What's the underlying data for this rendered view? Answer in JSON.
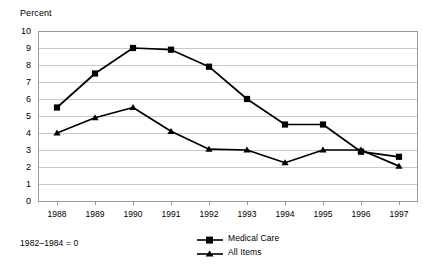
{
  "chart_data": {
    "type": "line",
    "title": "",
    "ylabel": "Percent",
    "xlabel": "",
    "note": "1982–1984 = 0",
    "categories": [
      "1988",
      "1989",
      "1990",
      "1991",
      "1992",
      "1993",
      "1994",
      "1995",
      "1996",
      "1997"
    ],
    "ylim": [
      0,
      10
    ],
    "ytick_values": [
      "10",
      "9",
      "8",
      "7",
      "6",
      "5",
      "4",
      "3",
      "2",
      "1",
      "0"
    ],
    "ytick_step": 1,
    "grid": "horizontal",
    "legend_position": "bottom-center",
    "series": [
      {
        "name": "Medical Care",
        "marker": "square",
        "color": "#000000",
        "values": [
          5.5,
          7.5,
          9.0,
          8.9,
          7.9,
          6.0,
          4.5,
          4.5,
          2.9,
          2.6
        ]
      },
      {
        "name": "All Items",
        "marker": "triangle",
        "color": "#000000",
        "values": [
          4.0,
          4.9,
          5.5,
          4.1,
          3.05,
          3.0,
          2.25,
          3.0,
          3.0,
          2.05
        ]
      }
    ]
  },
  "chart_geometry": {
    "plot_left": 38,
    "plot_right": 418,
    "plot_top": 31,
    "plot_bottom": 201,
    "axis_color": "#9a9a9a",
    "grid_color": "#c8c8c8"
  }
}
